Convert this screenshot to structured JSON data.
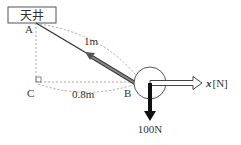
{
  "diagram": {
    "ceiling_label": "天井",
    "points": {
      "A": "A",
      "B": "B",
      "C": "C"
    },
    "lengths": {
      "AB": "1m",
      "CB": "0.8m"
    },
    "forces": {
      "weight": "100N",
      "unknown_prefix": "x",
      "unknown_unit": "[N]"
    },
    "colors": {
      "line": "#333333",
      "dashed": "#999999",
      "tension_arrow": "#666666",
      "weight_arrow": "#111111"
    }
  }
}
